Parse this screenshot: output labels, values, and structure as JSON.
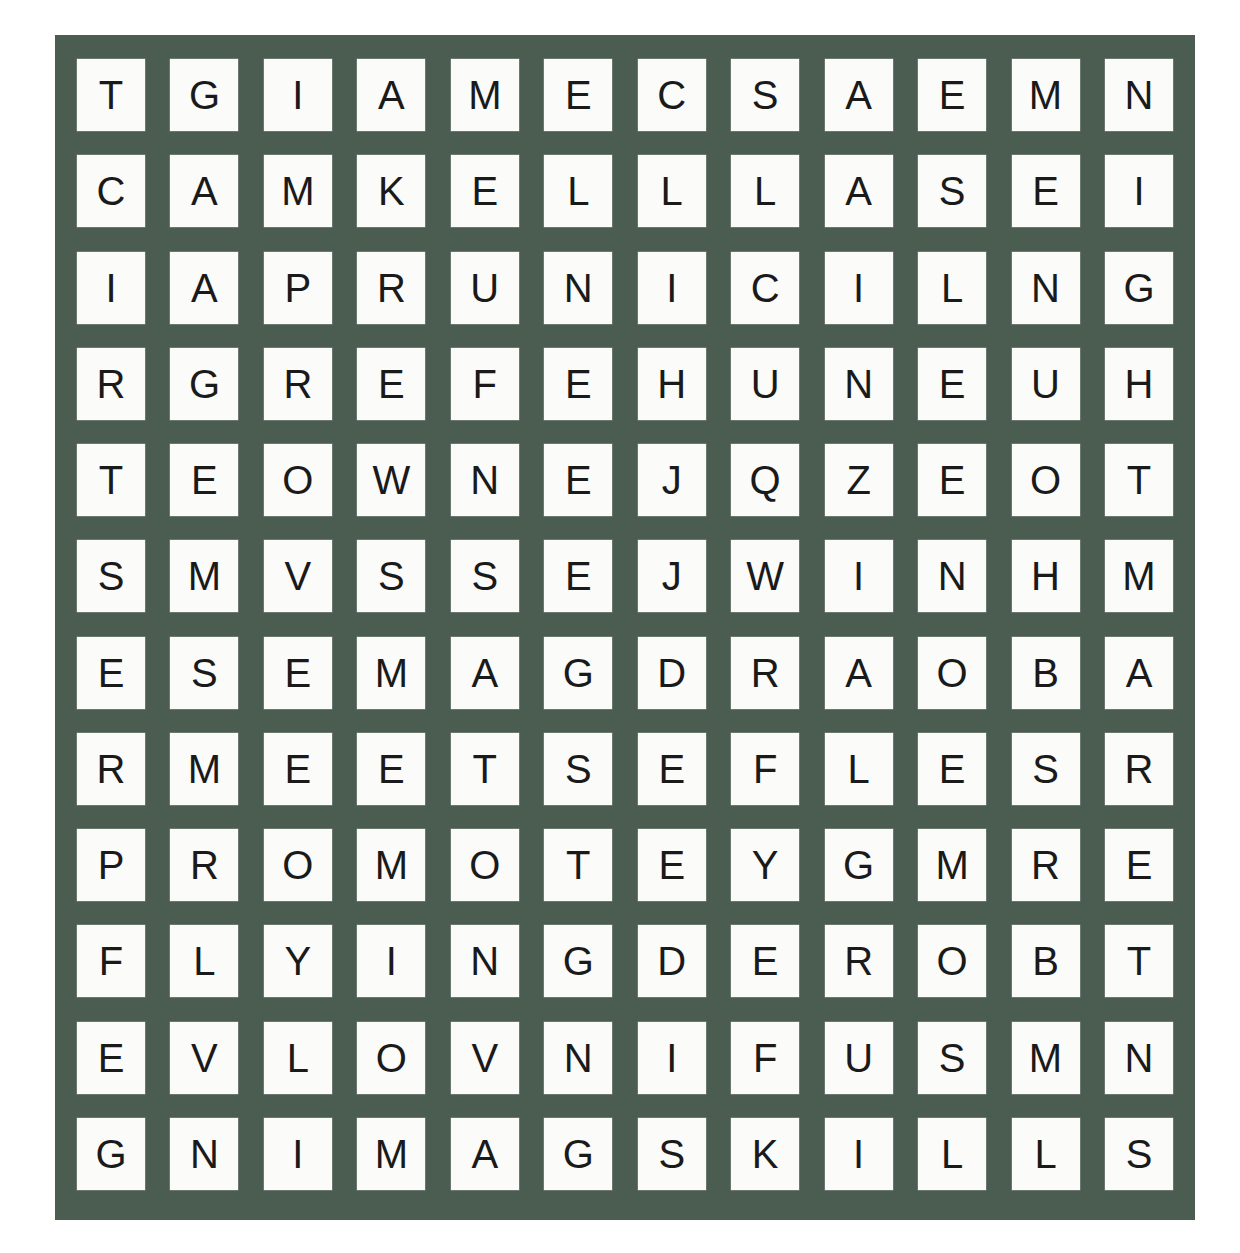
{
  "puzzle": {
    "type": "word-search",
    "rows": 12,
    "columns": 12,
    "board_color": "#4b5c51",
    "tile_color": "#fbfbf9",
    "letter_color": "#1a1a1a",
    "page_background": "#ffffff",
    "grid": [
      [
        "T",
        "G",
        "I",
        "A",
        "M",
        "E",
        "C",
        "S",
        "A",
        "E",
        "M",
        "N"
      ],
      [
        "C",
        "A",
        "M",
        "K",
        "E",
        "L",
        "L",
        "L",
        "A",
        "S",
        "E",
        "I"
      ],
      [
        "I",
        "A",
        "P",
        "R",
        "U",
        "N",
        "I",
        "C",
        "I",
        "L",
        "N",
        "G"
      ],
      [
        "R",
        "G",
        "R",
        "E",
        "F",
        "E",
        "H",
        "U",
        "N",
        "E",
        "U",
        "H"
      ],
      [
        "T",
        "E",
        "O",
        "W",
        "N",
        "E",
        "J",
        "Q",
        "Z",
        "E",
        "O",
        "T"
      ],
      [
        "S",
        "M",
        "V",
        "S",
        "S",
        "E",
        "J",
        "W",
        "I",
        "N",
        "H",
        "M"
      ],
      [
        "E",
        "S",
        "E",
        "M",
        "A",
        "G",
        "D",
        "R",
        "A",
        "O",
        "B",
        "A"
      ],
      [
        "R",
        "M",
        "E",
        "E",
        "T",
        "S",
        "E",
        "F",
        "L",
        "E",
        "S",
        "R"
      ],
      [
        "P",
        "R",
        "O",
        "M",
        "O",
        "T",
        "E",
        "Y",
        "G",
        "M",
        "R",
        "E"
      ],
      [
        "F",
        "L",
        "Y",
        "I",
        "N",
        "G",
        "D",
        "E",
        "R",
        "O",
        "B",
        "T"
      ],
      [
        "E",
        "V",
        "L",
        "O",
        "V",
        "N",
        "I",
        "F",
        "U",
        "S",
        "M",
        "N"
      ],
      [
        "G",
        "N",
        "I",
        "M",
        "A",
        "G",
        "S",
        "K",
        "I",
        "L",
        "L",
        "S"
      ]
    ]
  }
}
